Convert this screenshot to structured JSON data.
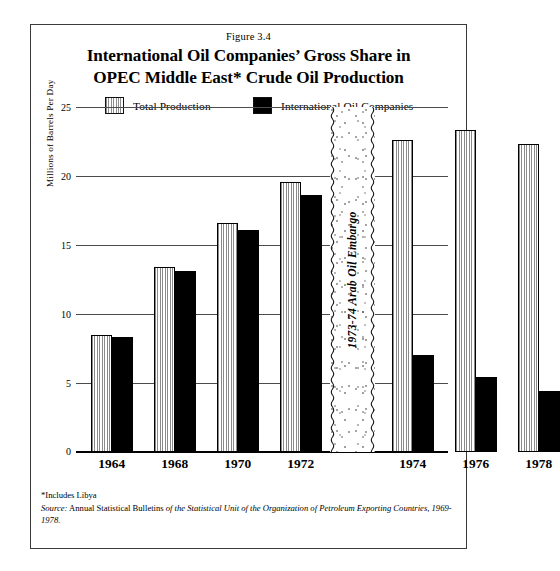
{
  "figure": {
    "number_label": "Figure 3.4",
    "title_line1": "International Oil Companies’ Gross Share in",
    "title_line2": "OPEC Middle East* Crude Oil Production"
  },
  "legend": {
    "items": [
      {
        "label": "Total Production",
        "swatch": "striped-gray-swatch",
        "color": "#8a8a8a"
      },
      {
        "label": "International Oil Companies",
        "swatch": "solid-black-swatch",
        "color": "#000000"
      }
    ]
  },
  "annotation": {
    "embargo_label": "1973-74 Arab Oil Embargo"
  },
  "footnotes": {
    "includes": "*Includes Libya",
    "source_label": "Source:",
    "source_text_1": "Annual Statistical Bulletins",
    "source_text_2": "of the Statistical Unit of the Organization of Petroleum Exporting",
    "source_text_3": "Countries, 1969-1978."
  },
  "chart_data": {
    "type": "bar",
    "title": "International Oil Companies’ Gross Share in OPEC Middle East* Crude Oil Production",
    "subtitle": "Figure 3.4",
    "xlabel": "",
    "ylabel": "Millions of Barrels Per Day",
    "ylim": [
      0,
      25
    ],
    "yticks": [
      0,
      5,
      10,
      15,
      20,
      25
    ],
    "ytick_labels": [
      "0",
      "5",
      "10",
      "15",
      "20",
      "25"
    ],
    "grid": true,
    "legend_position": "top",
    "categories": [
      "1964",
      "1968",
      "1970",
      "1972",
      "1974",
      "1976",
      "1978"
    ],
    "series": [
      {
        "name": "Total Production",
        "values": [
          8.5,
          13.4,
          16.6,
          19.6,
          22.6,
          23.3,
          22.3
        ]
      },
      {
        "name": "International Oil Companies",
        "values": [
          8.3,
          13.1,
          16.1,
          18.6,
          7.0,
          5.4,
          4.4
        ]
      }
    ],
    "annotations": [
      {
        "text": "1973-74 Arab Oil Embargo",
        "between": [
          "1972",
          "1974"
        ],
        "orientation": "vertical"
      }
    ]
  }
}
